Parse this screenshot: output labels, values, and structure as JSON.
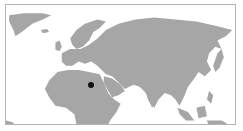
{
  "map": {
    "region": "Eastern Hemisphere (Europe, Africa, Asia)",
    "land_color": "#a6a6a6",
    "water_color": "#ffffff",
    "border_color": "#b4b4b4",
    "marker": {
      "label": "location-marker",
      "color": "#111111",
      "x": 90,
      "y": 84
    }
  }
}
